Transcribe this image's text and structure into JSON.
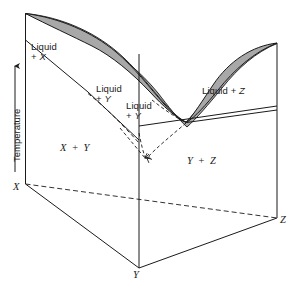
{
  "figure": {
    "type": "ternary-phase-diagram",
    "title": "",
    "background_color": "#ffffff",
    "line_color": "#1a1a1a",
    "liquidus_fill_color": "#a8a8a8",
    "width": 297,
    "height": 289
  },
  "axis": {
    "temperature_label": "Temperature",
    "arrow_direction": "up"
  },
  "vertices": [
    {
      "name": "vertex-x",
      "label": "X",
      "x": 14,
      "y": 188
    },
    {
      "name": "vertex-y",
      "label": "Y",
      "x": 133,
      "y": 284
    },
    {
      "name": "vertex-z",
      "label": "Z",
      "x": 281,
      "y": 224
    }
  ],
  "regions": [
    {
      "name": "liquid-plus-x",
      "label": "Liquid\n+ X",
      "x": 31,
      "y": 42
    },
    {
      "name": "liquid-plus-y-left",
      "label": "Liquid\n+ Y",
      "x": 96,
      "y": 84
    },
    {
      "name": "liquid-plus-y-right",
      "label": "Liquid\n+ Y",
      "x": 129,
      "y": 101
    },
    {
      "name": "liquid-plus-z",
      "label": "Liquid + Z",
      "x": 203,
      "y": 88
    },
    {
      "name": "x-plus-y",
      "label": "X + Y",
      "x": 62,
      "y": 144
    },
    {
      "name": "y-plus-z",
      "label": "Y + Z",
      "x": 189,
      "y": 156
    }
  ],
  "chart_data": {
    "type": "diagram",
    "components": [
      "X",
      "Y",
      "Z"
    ],
    "phase_fields": [
      "Liquid + X",
      "Liquid + Y",
      "Liquid + Y",
      "Liquid + Z",
      "X + Y",
      "Y + Z"
    ],
    "ylabel": "Temperature",
    "grid": false,
    "legend": "none"
  }
}
